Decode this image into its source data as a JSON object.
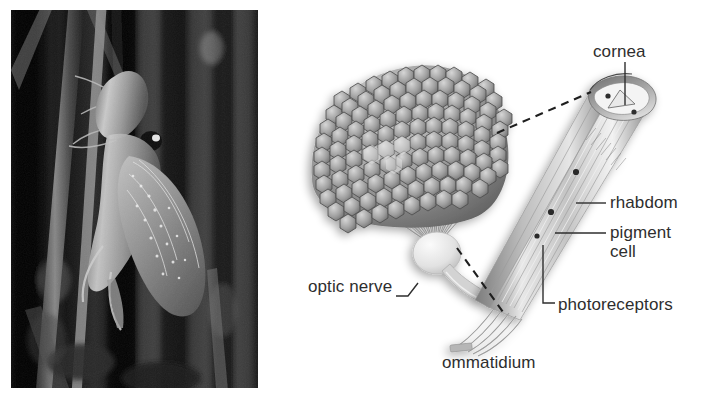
{
  "figure": {
    "background_color": "#ffffff",
    "panels": [
      {
        "id": "photo",
        "kind": "photograph",
        "caption": ""
      },
      {
        "id": "diagram",
        "kind": "anatomical-diagram",
        "caption": ""
      }
    ]
  },
  "photo_panel": {
    "subject": "insect on plant stems",
    "style": "black-and-white photograph",
    "border_color": "#111111",
    "background_color": "#0b0b0b"
  },
  "diagram": {
    "line_color": "#3a3a3a",
    "fill_light": "#e9e9e9",
    "fill_mid": "#b4b4b4",
    "fill_dark": "#7b7b7b",
    "labels": {
      "cornea": "cornea",
      "rhabdom": "rhabdom",
      "pigment_cell_line1": "pigment",
      "pigment_cell_line2": "cell",
      "photoreceptors": "photoreceptors",
      "optic_nerve": "optic nerve",
      "ommatidium": "ommatidium"
    },
    "parts": [
      {
        "name": "compound-eye",
        "description": "dome of hexagonal facets"
      },
      {
        "name": "ommatidia-bundle",
        "description": "radiating fibers converging to optic nerve"
      },
      {
        "name": "optic-nerve-bulb",
        "description": "pale bulb and stalk"
      },
      {
        "name": "ommatidium-enlargement",
        "description": "cut-away elongated ommatidium"
      },
      {
        "name": "axon-bundle",
        "description": "nerve fibers leaving base of ommatidium"
      }
    ],
    "connectors": [
      {
        "name": "callout-top",
        "style": "dashed"
      },
      {
        "name": "callout-bottom",
        "style": "dashed"
      }
    ]
  }
}
